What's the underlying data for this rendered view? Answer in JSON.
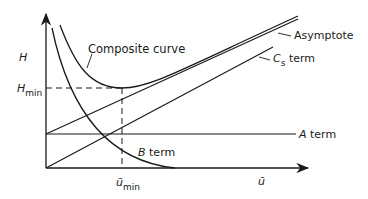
{
  "diagram": {
    "type": "van Deemter plot",
    "y_axis": {
      "label": "H",
      "marker_label": "H",
      "marker_subscript": "min"
    },
    "x_axis": {
      "label": "ū",
      "marker_label": "ū",
      "marker_subscript": "min"
    },
    "curves": [
      {
        "name": "Composite curve",
        "label": "Composite curve"
      },
      {
        "name": "Asymptote",
        "label": "Asymptote"
      },
      {
        "name": "Cs term",
        "label_main": "C",
        "label_subscript": "s",
        "label_suffix": "term"
      },
      {
        "name": "A term",
        "label_main": "A",
        "label_suffix": "term"
      },
      {
        "name": "B term",
        "label_main": "B",
        "label_suffix": "term"
      }
    ],
    "colors": {
      "line": "#1a1a1a",
      "background": "#ffffff"
    }
  }
}
